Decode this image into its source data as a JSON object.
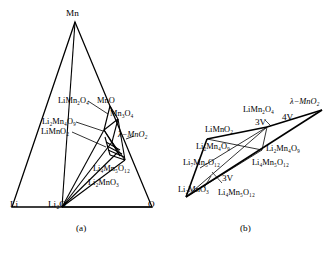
{
  "figure": {
    "panels": [
      {
        "id": "a",
        "caption": "(a)",
        "type": "ternary-phase-diagram",
        "corners": [
          {
            "name": "Li",
            "text": "Li"
          },
          {
            "name": "Li2O",
            "text": "Li₂O"
          },
          {
            "name": "O",
            "text": "O"
          },
          {
            "name": "Mn",
            "text": "Mn"
          }
        ],
        "phase_labels": [
          {
            "name": "LiMn2O4",
            "text": "LiMn₂O₄"
          },
          {
            "name": "MnO",
            "text": "MnO"
          },
          {
            "name": "Li2Mn4O9",
            "text": "Li₂Mn₄O₉"
          },
          {
            "name": "Mn3O4",
            "text": "Mn₃O₄"
          },
          {
            "name": "LiMnO2",
            "text": "LiMnO₂"
          },
          {
            "name": "lambda-MnO2",
            "text": "λ−MnO₂"
          },
          {
            "name": "Li4Mn5O12",
            "text": "Li₄Mn₅O₁₂"
          },
          {
            "name": "Li2MnO3",
            "text": "Li₂MnO₃"
          }
        ]
      },
      {
        "id": "b",
        "caption": "(b)",
        "type": "composition-network",
        "phase_labels": [
          {
            "name": "LiMn2O4",
            "text": "LiMn₂O₄"
          },
          {
            "name": "lambda-MnO2",
            "text": "λ−MnO₂"
          },
          {
            "name": "LiMnO2",
            "text": "LiMnO₂"
          },
          {
            "name": "Li2Mn4O9-left",
            "text": "Li₂Mn₄O₉"
          },
          {
            "name": "Li2Mn4O9-right",
            "text": "Li₂Mn₄O₉"
          },
          {
            "name": "Li7Mn5O12",
            "text": "Li₇Mn₅O₁₂"
          },
          {
            "name": "Li4Mn5O12-mid",
            "text": "Li₄Mn₅O₁₂"
          },
          {
            "name": "Li2MnO3",
            "text": "Li₂MnO₃"
          },
          {
            "name": "Li4Mn5O12-bottom",
            "text": "Li₄Mn₅O₁₂"
          }
        ],
        "voltage_labels": [
          {
            "name": "4V",
            "text": "4V"
          },
          {
            "name": "3V-upper",
            "text": "3V"
          },
          {
            "name": "3V-lower",
            "text": "3V"
          }
        ]
      }
    ],
    "colors": {
      "line": "#000000",
      "background": "#ffffff"
    }
  }
}
